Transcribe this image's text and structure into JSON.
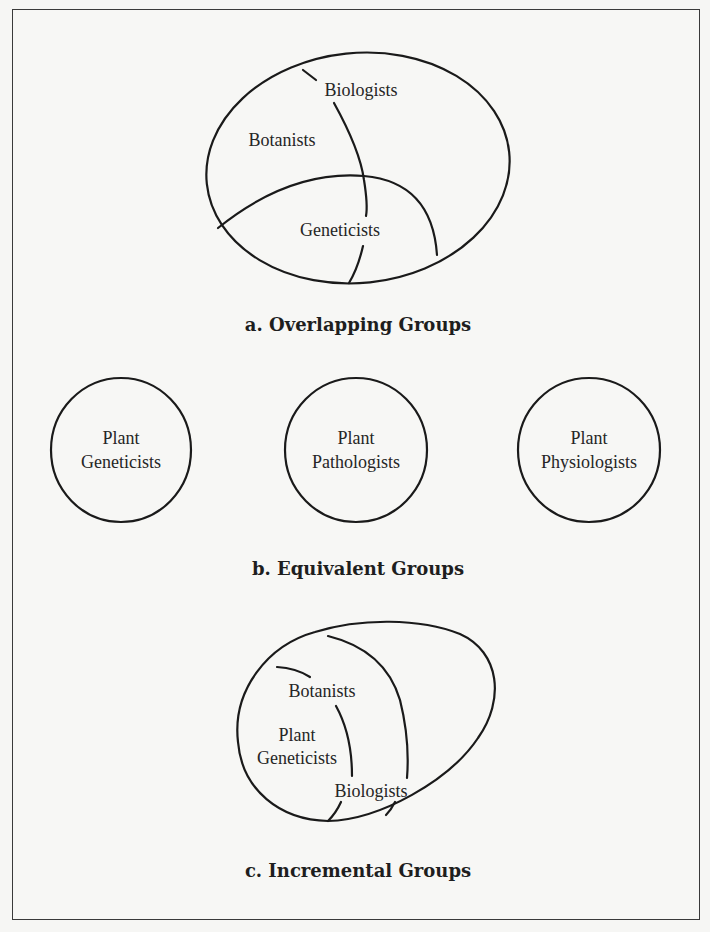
{
  "figure": {
    "panels": [
      {
        "id": "a",
        "caption": "a.  Overlapping Groups",
        "shape": "ellipse-with-intersecting-arcs",
        "groups": [
          {
            "label": "Biologists"
          },
          {
            "label": "Botanists"
          },
          {
            "label": "Geneticists"
          }
        ]
      },
      {
        "id": "b",
        "caption": "b.  Equivalent Groups",
        "shape": "three-separate-circles",
        "groups": [
          {
            "line1": "Plant",
            "line2": "Geneticists"
          },
          {
            "line1": "Plant",
            "line2": "Pathologists"
          },
          {
            "line1": "Plant",
            "line2": "Physiologists"
          }
        ]
      },
      {
        "id": "c",
        "caption": "c.  Incremental Groups",
        "shape": "nested-regions",
        "groups": [
          {
            "label": "Botanists"
          },
          {
            "line1": "Plant",
            "line2": "Geneticists"
          },
          {
            "label": "Biologists"
          }
        ]
      }
    ],
    "colors": {
      "stroke": "#1a1a1a",
      "text": "#262626",
      "background": "#f7f7f5",
      "frame": "#3a3a3a"
    }
  }
}
